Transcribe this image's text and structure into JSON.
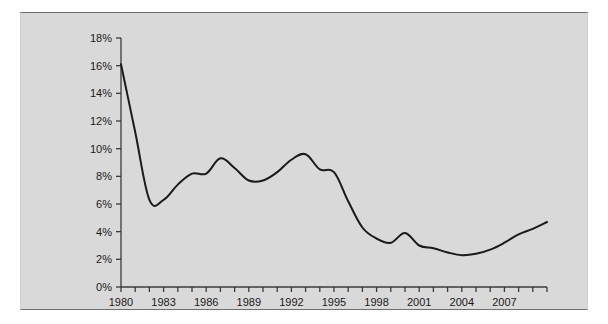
{
  "figure": {
    "background_color": "#d9d9d9",
    "page_background_color": "#ffffff",
    "frame_border_color": "#6e6e6e"
  },
  "chart_data": {
    "type": "line",
    "title": "",
    "subtitle": "",
    "xlabel": "",
    "ylabel": "",
    "xlim": [
      1980,
      2010
    ],
    "ylim": [
      0,
      18
    ],
    "grid": false,
    "legend": "none",
    "line_color": "#1a1a1a",
    "line_width": 2,
    "y_tick_labels": [
      "0%",
      "2%",
      "4%",
      "6%",
      "8%",
      "10%",
      "12%",
      "14%",
      "16%",
      "18%"
    ],
    "y_tick_values": [
      0,
      2,
      4,
      6,
      8,
      10,
      12,
      14,
      16,
      18
    ],
    "x_tick_labels": [
      "1980",
      "1983",
      "1986",
      "1989",
      "1992",
      "1995",
      "1998",
      "2001",
      "2004",
      "2007"
    ],
    "x_tick_values": [
      1980,
      1983,
      1986,
      1989,
      1992,
      1995,
      1998,
      2001,
      2004,
      2007
    ],
    "x_minor_tick_values": [
      1980,
      1981,
      1982,
      1983,
      1984,
      1985,
      1986,
      1987,
      1988,
      1989,
      1990,
      1991,
      1992,
      1993,
      1994,
      1995,
      1996,
      1997,
      1998,
      1999,
      2000,
      2001,
      2002,
      2003,
      2004,
      2005,
      2006,
      2007,
      2008,
      2009,
      2010
    ],
    "x": [
      1980,
      1981,
      1982,
      1983,
      1984,
      1985,
      1986,
      1987,
      1988,
      1989,
      1990,
      1991,
      1992,
      1993,
      1994,
      1995,
      1996,
      1997,
      1998,
      1999,
      2000,
      2001,
      2002,
      2003,
      2004,
      2005,
      2006,
      2007,
      2008,
      2009,
      2010
    ],
    "values": [
      16.1,
      11.2,
      6.3,
      6.3,
      7.4,
      8.2,
      8.2,
      9.3,
      8.6,
      7.7,
      7.7,
      8.3,
      9.2,
      9.6,
      8.5,
      8.3,
      6.2,
      4.3,
      3.5,
      3.2,
      3.9,
      3.0,
      2.8,
      2.5,
      2.3,
      2.4,
      2.7,
      3.2,
      3.8,
      4.2,
      4.7
    ]
  }
}
